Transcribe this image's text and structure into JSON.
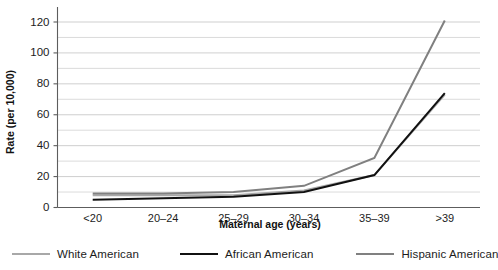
{
  "chart_data": {
    "type": "line",
    "title": "",
    "xlabel": "Maternal age (years)",
    "ylabel": "Rate (per 10,000)",
    "categories": [
      "<20",
      "20–24",
      "25–29",
      "30–34",
      "35–39",
      ">39"
    ],
    "ylim": [
      0,
      130
    ],
    "ytick_labels": [
      "0",
      "20",
      "40",
      "60",
      "80",
      "100",
      "120"
    ],
    "ytick_values": [
      0,
      20,
      40,
      60,
      80,
      100,
      120
    ],
    "gridlines": [
      0,
      10,
      20,
      30,
      40,
      50,
      60,
      70,
      80,
      90,
      100,
      110,
      120
    ],
    "grid": true,
    "legend_position": "bottom",
    "series": [
      {
        "name": "White American",
        "color": "#a8a8a8",
        "width": 2.0,
        "values": [
          8,
          8,
          8,
          11,
          21,
          73
        ]
      },
      {
        "name": "African American",
        "color": "#111111",
        "width": 2.0,
        "values": [
          5,
          6,
          7,
          10,
          21,
          74
        ]
      },
      {
        "name": "Hispanic American",
        "color": "#808080",
        "width": 2.0,
        "values": [
          9,
          9,
          10,
          14,
          32,
          121
        ]
      }
    ]
  },
  "axis": {
    "y_title": "Rate (per 10,000)",
    "x_title": "Maternal age (years)"
  },
  "legend": {
    "items": [
      {
        "label": "White American",
        "color": "#a8a8a8",
        "thickness": "2px"
      },
      {
        "label": "African American",
        "color": "#111111",
        "thickness": "2.4px"
      },
      {
        "label": "Hispanic American",
        "color": "#808080",
        "thickness": "2.2px"
      }
    ]
  }
}
